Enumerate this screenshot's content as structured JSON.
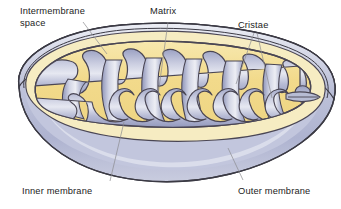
{
  "figure": {
    "background_color": "#ffffff"
  },
  "labels": {
    "intermembrane_space_line1": "Intermembrane",
    "intermembrane_space_line2": "space",
    "matrix": "Matrix",
    "cristae": "Cristae",
    "inner_membrane": "Inner membrane",
    "outer_membrane": "Outer membrane"
  },
  "colors": {
    "matrix_fill": "#f3dc91",
    "matrix_fill_light": "#f8ecbe",
    "cristae_fill": "#a3a9c9",
    "cristae_highlight": "#e4e7f2",
    "body_fill": "#b9bdd6",
    "body_highlight": "#e8eaf3",
    "membrane_stroke": "#4a4654",
    "outer_stroke": "#3b3a44",
    "leader_line": "#8b8b8f",
    "text": "#232323"
  },
  "structures": [
    {
      "name": "outer-membrane",
      "description": "Smooth outer envelope of the organelle"
    },
    {
      "name": "inner-membrane",
      "description": "Folded inner envelope forming cristae"
    },
    {
      "name": "intermembrane-space",
      "description": "Narrow gap between outer and inner membranes"
    },
    {
      "name": "matrix",
      "description": "Yellow interior compartment enclosed by inner membrane"
    },
    {
      "name": "cristae",
      "description": "Infoldings of inner membrane projecting into the matrix"
    }
  ]
}
